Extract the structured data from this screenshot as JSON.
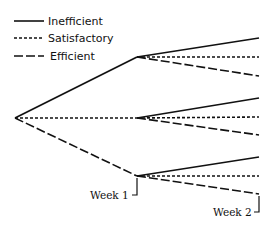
{
  "legend": {
    "items": [
      {
        "label": "Inefficient",
        "style": "solid"
      },
      {
        "label": "Satisfactory",
        "style": "dotted"
      },
      {
        "label": "Efficient",
        "style": "dashed"
      }
    ]
  },
  "diagram": {
    "type": "decision-tree",
    "root": {
      "x": 15,
      "y": 118
    },
    "week1_nodes": [
      {
        "x": 137,
        "y": 57,
        "from_style": "solid"
      },
      {
        "x": 137,
        "y": 118,
        "from_style": "dotted"
      },
      {
        "x": 137,
        "y": 176,
        "from_style": "dashed"
      }
    ],
    "week2_ends_y": [
      [
        38,
        57,
        76
      ],
      [
        98,
        117,
        135
      ],
      [
        157,
        176,
        194
      ]
    ],
    "labels": {
      "week1": "Week 1",
      "week2": "Week 2"
    },
    "line_color": "#111111"
  }
}
